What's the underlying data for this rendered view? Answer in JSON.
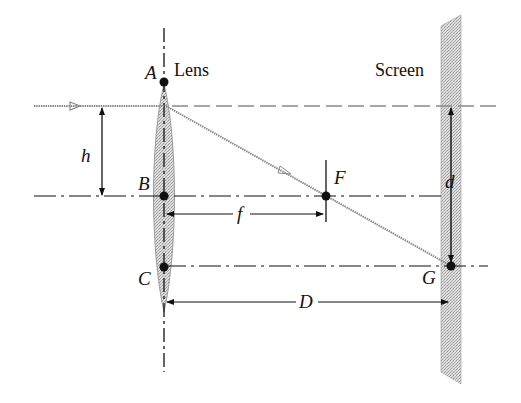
{
  "figure": {
    "labels": {
      "lens": "Lens",
      "screen": "Screen",
      "point_a": "A",
      "point_b": "B",
      "point_c": "C",
      "point_f": "F",
      "point_g": "G",
      "height": "h",
      "focal_length": "f",
      "distance": "D",
      "spot_offset": "d"
    },
    "colors": {
      "ink": "#111111",
      "ray": "#8a8a8a",
      "lens_fill": "#cfcfcf",
      "screen_fill": "#d4d4d4"
    }
  }
}
